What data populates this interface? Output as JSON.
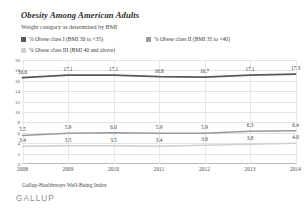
{
  "header": {
    "title": "Obesity Among American Adults",
    "subtitle": "Weight category as determined by BMI"
  },
  "footer": {
    "source": "Gallup-Healthways Well-Being Index",
    "brand": "GALLUP"
  },
  "colors": {
    "class_i": "#585858",
    "class_ii": "#9a9a9a",
    "class_iii": "#cfcfcf",
    "grid": "#e2e2e2",
    "axis": "#b9b9b9"
  },
  "chart_data": {
    "type": "line",
    "title": "Obesity Among American Adults",
    "subtitle": "Weight category as determined by BMI",
    "xlabel": "",
    "ylabel": "",
    "ylim": [
      0,
      20
    ],
    "yticks": [
      20,
      18,
      16,
      14,
      12,
      10,
      8,
      6,
      4,
      2,
      0
    ],
    "ytick_labels": [
      "20",
      "18",
      "16",
      "14",
      "12",
      "10",
      "8",
      "6",
      "4",
      "2",
      "0"
    ],
    "grid": true,
    "legend_position": "top",
    "categories": [
      "2008",
      "2009",
      "2010",
      "2011",
      "2012",
      "2013",
      "2014"
    ],
    "series": [
      {
        "name": "% Obese class I (BMI 30 to <35)",
        "color": "#585858",
        "values": [
          16.6,
          17.1,
          17.1,
          16.8,
          16.7,
          17.1,
          17.3
        ],
        "labels": [
          "16.6",
          "17.1",
          "17.1",
          "16.8",
          "16.7",
          "17.1",
          "17.3"
        ]
      },
      {
        "name": "% Obese class II (BMI 35 to <40)",
        "color": "#9a9a9a",
        "values": [
          5.5,
          5.9,
          6.0,
          5.9,
          5.9,
          6.3,
          6.4
        ],
        "labels": [
          "5.5",
          "5.9",
          "6.0",
          "5.9",
          "5.9",
          "6.3",
          "6.4"
        ]
      },
      {
        "name": "% Obese class III (BMI 40 and above)",
        "color": "#cfcfcf",
        "values": [
          3.4,
          3.5,
          3.5,
          3.4,
          3.6,
          3.8,
          4.0
        ],
        "labels": [
          "3.4",
          "3.5",
          "3.5",
          "3.4",
          "3.6",
          "3.8",
          "4.0"
        ]
      }
    ]
  }
}
